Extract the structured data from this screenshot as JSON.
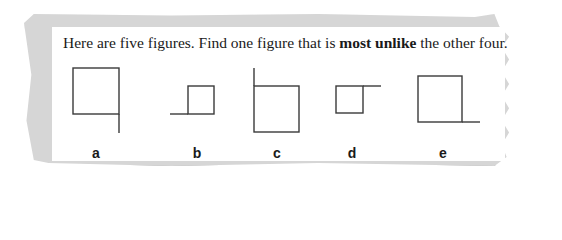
{
  "question": {
    "prefix": "Here are five figures. Find one figure that is ",
    "emphasis": "most unlike",
    "suffix": " the other four."
  },
  "figures": [
    {
      "label": "a",
      "description": "large square with line extending down from bottom-right corner"
    },
    {
      "label": "b",
      "description": "small square with line extending left from bottom-left corner"
    },
    {
      "label": "c",
      "description": "large square with line extending up from top-left corner"
    },
    {
      "label": "d",
      "description": "small square with line extending right from top-right corner"
    },
    {
      "label": "e",
      "description": "large square with line extending right from bottom-right corner"
    }
  ],
  "colors": {
    "stroke": "#3a3a3a",
    "paper": "#ffffff",
    "border": "#d6d6d6"
  }
}
